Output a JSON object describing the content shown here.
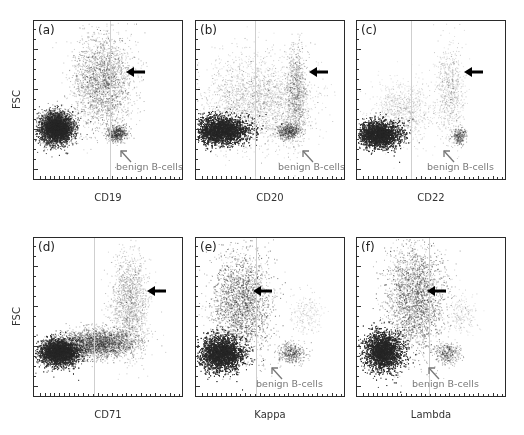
{
  "figure": {
    "panels": [
      {
        "id": "a",
        "label": "(a)",
        "xlabel": "CD19",
        "ylabel": "FSC",
        "show_ylabel": true,
        "left": 33,
        "top": 20,
        "gate_x": 76,
        "arrow": {
          "x": 92,
          "y": 46
        },
        "benign": {
          "text": "benign B-cells",
          "show": true,
          "tx": 82,
          "ty": 140,
          "ax": 85,
          "ay": 128
        },
        "clusters": [
          {
            "cx": 22,
            "cy": 107,
            "rx": 16,
            "ry": 15,
            "n": 5500,
            "shade": 0.85
          },
          {
            "cx": 68,
            "cy": 60,
            "rx": 30,
            "ry": 45,
            "n": 2600,
            "shade": 0.35
          },
          {
            "cx": 83,
            "cy": 112,
            "rx": 10,
            "ry": 8,
            "n": 500,
            "shade": 0.55
          }
        ]
      },
      {
        "id": "b",
        "label": "(b)",
        "xlabel": "CD20",
        "ylabel": "",
        "show_ylabel": false,
        "left": 195,
        "top": 20,
        "gate_x": 59,
        "arrow": {
          "x": 113,
          "y": 46
        },
        "benign": {
          "text": "benign B-cells",
          "show": true,
          "tx": 82,
          "ty": 140,
          "ax": 105,
          "ay": 128
        },
        "clusters": [
          {
            "cx": 25,
            "cy": 109,
            "rx": 28,
            "ry": 14,
            "n": 6500,
            "shade": 0.85
          },
          {
            "cx": 60,
            "cy": 80,
            "rx": 55,
            "ry": 45,
            "n": 2400,
            "shade": 0.25
          },
          {
            "cx": 100,
            "cy": 70,
            "rx": 10,
            "ry": 45,
            "n": 900,
            "shade": 0.35
          },
          {
            "cx": 92,
            "cy": 110,
            "rx": 12,
            "ry": 8,
            "n": 500,
            "shade": 0.5
          }
        ]
      },
      {
        "id": "c",
        "label": "(c)",
        "xlabel": "CD22",
        "ylabel": "",
        "show_ylabel": false,
        "left": 356,
        "top": 20,
        "gate_x": 54,
        "arrow": {
          "x": 107,
          "y": 46
        },
        "benign": {
          "text": "benign B-cells",
          "show": true,
          "tx": 70,
          "ty": 140,
          "ax": 85,
          "ay": 128
        },
        "clusters": [
          {
            "cx": 22,
            "cy": 113,
            "rx": 21,
            "ry": 13,
            "n": 5500,
            "shade": 0.85
          },
          {
            "cx": 45,
            "cy": 90,
            "rx": 30,
            "ry": 30,
            "n": 900,
            "shade": 0.2
          },
          {
            "cx": 92,
            "cy": 70,
            "rx": 14,
            "ry": 48,
            "n": 700,
            "shade": 0.25
          },
          {
            "cx": 102,
            "cy": 115,
            "rx": 8,
            "ry": 8,
            "n": 280,
            "shade": 0.45
          }
        ]
      },
      {
        "id": "d",
        "label": "(d)",
        "xlabel": "CD71",
        "ylabel": "FSC",
        "show_ylabel": true,
        "left": 33,
        "top": 237,
        "gate_x": 60,
        "arrow": {
          "x": 113,
          "y": 48
        },
        "benign": {
          "text": "",
          "show": false
        },
        "clusters": [
          {
            "cx": 25,
            "cy": 114,
            "rx": 20,
            "ry": 13,
            "n": 5500,
            "shade": 0.85
          },
          {
            "cx": 65,
            "cy": 105,
            "rx": 35,
            "ry": 14,
            "n": 2500,
            "shade": 0.45
          },
          {
            "cx": 95,
            "cy": 65,
            "rx": 18,
            "ry": 50,
            "n": 1500,
            "shade": 0.3
          }
        ]
      },
      {
        "id": "e",
        "label": "(e)",
        "xlabel": "Kappa",
        "ylabel": "",
        "show_ylabel": false,
        "left": 195,
        "top": 237,
        "gate_x": 60,
        "arrow": {
          "x": 57,
          "y": 48
        },
        "benign": {
          "text": "benign B-cells",
          "show": true,
          "tx": 60,
          "ty": 140,
          "ax": 74,
          "ay": 128
        },
        "clusters": [
          {
            "cx": 25,
            "cy": 115,
            "rx": 22,
            "ry": 17,
            "n": 6000,
            "shade": 0.85
          },
          {
            "cx": 45,
            "cy": 65,
            "rx": 30,
            "ry": 50,
            "n": 3500,
            "shade": 0.35
          },
          {
            "cx": 95,
            "cy": 115,
            "rx": 14,
            "ry": 10,
            "n": 450,
            "shade": 0.45
          },
          {
            "cx": 110,
            "cy": 75,
            "rx": 15,
            "ry": 20,
            "n": 200,
            "shade": 0.2
          }
        ]
      },
      {
        "id": "f",
        "label": "(f)",
        "xlabel": "Lambda",
        "ylabel": "",
        "show_ylabel": false,
        "left": 356,
        "top": 237,
        "gate_x": 72,
        "arrow": {
          "x": 70,
          "y": 48
        },
        "benign": {
          "text": "benign B-cells",
          "show": true,
          "tx": 55,
          "ty": 140,
          "ax": 70,
          "ay": 128
        },
        "clusters": [
          {
            "cx": 26,
            "cy": 113,
            "rx": 18,
            "ry": 19,
            "n": 5800,
            "shade": 0.85
          },
          {
            "cx": 58,
            "cy": 60,
            "rx": 28,
            "ry": 55,
            "n": 3600,
            "shade": 0.35
          },
          {
            "cx": 90,
            "cy": 115,
            "rx": 12,
            "ry": 10,
            "n": 350,
            "shade": 0.45
          },
          {
            "cx": 105,
            "cy": 75,
            "rx": 15,
            "ry": 20,
            "n": 200,
            "shade": 0.2
          }
        ]
      }
    ]
  },
  "colors": {
    "dots": "#2b2b2b",
    "frame": "#2a2a2a",
    "benign_text": "#7a7a7a",
    "gate_line": "#cfcfcf"
  }
}
